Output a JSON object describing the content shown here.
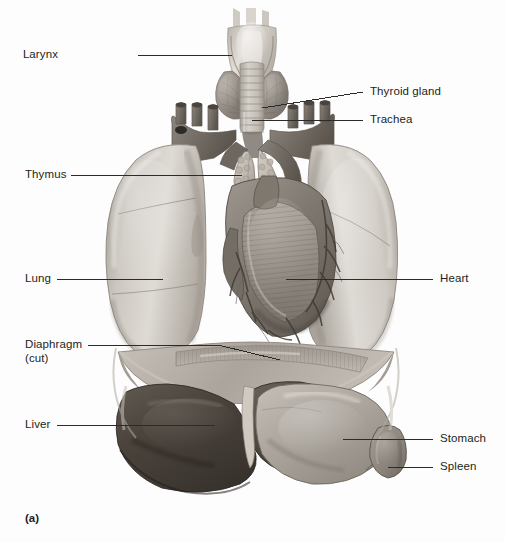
{
  "figure": {
    "caption": "(a)",
    "type": "anatomical-illustration",
    "style": "grayscale medical illustration",
    "width": 505,
    "height": 542
  },
  "colors": {
    "background": "#fdfdfd",
    "label_text": "#231f20",
    "leader_line": "#2b2b2b",
    "lung_light": "#d8d4cf",
    "lung_mid": "#bdb8b2",
    "lung_shadow": "#9a948d",
    "heart_dark": "#6e6861",
    "heart_mid": "#8d867e",
    "liver_dark": "#4a443f",
    "liver_mid": "#5d5650",
    "stomach": "#a8a29b",
    "spleen": "#8e877f",
    "thymus": "#c9c3ba",
    "trachea": "#cdc8c1",
    "vessel": "#7c756d",
    "diaphragm": "#b5afa8"
  },
  "labels": [
    {
      "id": "larynx",
      "text": "Larynx",
      "side": "left",
      "x": 106,
      "y": 48,
      "line_x1": 138,
      "line_x2": 232,
      "line_y": 55
    },
    {
      "id": "thyroid",
      "text": "Thyroid gland",
      "side": "right",
      "x": 370,
      "y": 85,
      "line_x1": 330,
      "line_x2": 363,
      "line_y": 92
    },
    {
      "id": "trachea",
      "text": "Trachea",
      "side": "right",
      "x": 370,
      "y": 113,
      "line_x1": 272,
      "line_x2": 363,
      "line_y": 120
    },
    {
      "id": "thymus",
      "text": "Thymus",
      "side": "left",
      "x": 25,
      "y": 168,
      "line_x1": 71,
      "line_x2": 242,
      "line_y": 175
    },
    {
      "id": "lung",
      "text": "Lung",
      "side": "left",
      "x": 25,
      "y": 272,
      "line_x1": 57,
      "line_x2": 163,
      "line_y": 279
    },
    {
      "id": "heart",
      "text": "Heart",
      "side": "right",
      "x": 440,
      "y": 272,
      "line_x1": 330,
      "line_x2": 433,
      "line_y": 279
    },
    {
      "id": "diaphragm",
      "text": "Diaphragm",
      "side": "left",
      "x": 25,
      "y": 338,
      "line_x1": 88,
      "line_x2": 245,
      "line_y": 345
    },
    {
      "id": "diaphragm_cut",
      "text": "(cut)",
      "side": "left",
      "x": 25,
      "y": 352,
      "line_x1": 0,
      "line_x2": 0,
      "line_y": 0
    },
    {
      "id": "liver",
      "text": "Liver",
      "side": "left",
      "x": 25,
      "y": 418,
      "line_x1": 57,
      "line_x2": 215,
      "line_y": 425
    },
    {
      "id": "stomach",
      "text": "Stomach",
      "side": "right",
      "x": 440,
      "y": 432,
      "line_x1": 343,
      "line_x2": 433,
      "line_y": 439
    },
    {
      "id": "spleen",
      "text": "Spleen",
      "side": "right",
      "x": 440,
      "y": 460,
      "line_x1": 388,
      "line_x2": 433,
      "line_y": 467
    }
  ],
  "structures": [
    {
      "name": "larynx",
      "description": "hyoid bone and thyroid cartilage at top of airway"
    },
    {
      "name": "thyroid-gland",
      "description": "bilobed gland straddling upper trachea"
    },
    {
      "name": "trachea",
      "description": "ringed cartilaginous airway descending to bronchi"
    },
    {
      "name": "thymus",
      "description": "lobulated bilobed gland anterior to great vessels"
    },
    {
      "name": "right-lung",
      "description": "left side of image, three lobes with fissures"
    },
    {
      "name": "left-lung",
      "description": "right side of image, two lobes with cardiac notch"
    },
    {
      "name": "heart",
      "description": "central, coronary vessels and cut-away myocardium"
    },
    {
      "name": "great-vessels",
      "description": "aortic arch with brachiocephalic, carotid and subclavian stumps"
    },
    {
      "name": "diaphragm",
      "description": "cut dome-shaped muscle with striated cut edge"
    },
    {
      "name": "liver",
      "description": "dark large organ lower left with falciform ligament"
    },
    {
      "name": "stomach",
      "description": "lighter organ lower right of liver"
    },
    {
      "name": "spleen",
      "description": "small rounded organ at far lower right"
    }
  ]
}
